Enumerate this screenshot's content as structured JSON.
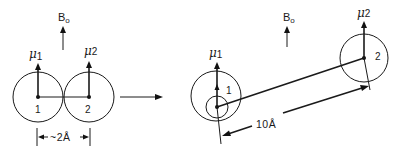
{
  "diagram": {
    "colors": {
      "ink": "#1a1a1a",
      "background": "#ffffff"
    },
    "field_label": {
      "main": "B",
      "subscript": "o"
    },
    "left_panel": {
      "nucleus_1": {
        "label": "1",
        "moment_symbol": "μ",
        "moment_index": "1"
      },
      "nucleus_2": {
        "label": "2",
        "moment_symbol": "μ",
        "moment_index": "2"
      },
      "distance_label": "~2Å"
    },
    "transition_arrow": "right-arrow",
    "right_panel": {
      "nucleus_1": {
        "label": "1",
        "moment_symbol": "μ",
        "moment_index": "1"
      },
      "nucleus_2": {
        "label": "2",
        "moment_symbol": "μ",
        "moment_index": "2"
      },
      "distance_label": "10Å"
    }
  }
}
